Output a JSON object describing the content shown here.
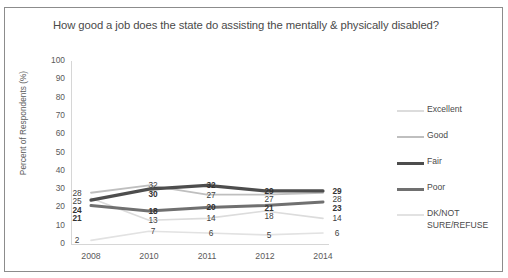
{
  "chart_data": {
    "type": "line",
    "title": "How good a job does the state do assisting the mentally & physically disabled?",
    "xlabel": "",
    "ylabel": "Percent of Respondents (%)",
    "categories": [
      "2008",
      "2010",
      "2011",
      "2012",
      "2014"
    ],
    "ylim": [
      0,
      100
    ],
    "yticks": [
      "100",
      "90",
      "80",
      "70",
      "60",
      "50",
      "40",
      "30",
      "20",
      "10",
      "0"
    ],
    "grid": false,
    "legend_position": "right",
    "series": [
      {
        "name": "Excellent",
        "color": "#dcdcdc",
        "width": 1.6,
        "values": [
          25,
          13,
          14,
          18,
          14
        ]
      },
      {
        "name": "Good",
        "color": "#bfbfbf",
        "width": 1.8,
        "values": [
          28,
          32,
          27,
          27,
          28
        ]
      },
      {
        "name": "Fair",
        "color": "#4d4d4d",
        "width": 3.2,
        "values": [
          24,
          30,
          32,
          29,
          29
        ]
      },
      {
        "name": "Poor",
        "color": "#707070",
        "width": 3.0,
        "values": [
          21,
          18,
          20,
          21,
          23
        ]
      },
      {
        "name": "DK/NOT\nSURE/REFUSE",
        "color": "#e2e2e2",
        "width": 1.6,
        "values": [
          2,
          7,
          6,
          5,
          6
        ]
      }
    ]
  },
  "legend": {
    "items": [
      {
        "label": "Excellent"
      },
      {
        "label": "Good"
      },
      {
        "label": "Fair"
      },
      {
        "label": "Poor"
      },
      {
        "label": "DK/NOT\nSURE/REFUSE"
      }
    ]
  },
  "labels": {
    "y2008": [
      "28",
      "25",
      "24",
      "21",
      "2"
    ],
    "y2010": [
      "32",
      "30",
      "18",
      "13",
      "7"
    ],
    "y2011": [
      "32",
      "27",
      "20",
      "14",
      "6"
    ],
    "y2012": [
      "29",
      "27",
      "21",
      "18",
      "5"
    ],
    "y2014": [
      "29",
      "28",
      "23",
      "14",
      "6"
    ]
  }
}
